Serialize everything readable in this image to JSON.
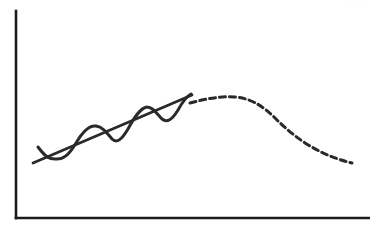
{
  "figure": {
    "width": 370,
    "height": 230,
    "background": "#ffffff",
    "corner_artifact": "···  ··"
  },
  "style": {
    "axis_color": "#1c1c1c",
    "axis_width": 2.6,
    "line_color": "#2a2a2a",
    "trend_width": 2.8,
    "noise_width": 3.0,
    "forecast_width": 3.0,
    "dash_pattern": "6 4"
  },
  "chart_data": {
    "type": "line",
    "title": "",
    "subtitle": "",
    "xlabel": "",
    "ylabel": "",
    "grid": false,
    "legend": "none",
    "xlim": [
      0,
      370
    ],
    "ylim": [
      0,
      230
    ],
    "axes": {
      "y_axis": {
        "x": 16,
        "y_top": 11,
        "y_bottom": 218
      },
      "x_axis": {
        "y": 218,
        "x_left": 16,
        "x_right": 370
      },
      "ticks": [],
      "tick_labels": []
    },
    "series": [
      {
        "name": "trend",
        "style": "solid",
        "description": "Rising straight trend line through the historical period",
        "points": [
          {
            "x": 33,
            "y": 163
          },
          {
            "x": 192,
            "y": 95
          }
        ],
        "path": "M 33 163 L 192 95"
      },
      {
        "name": "observed",
        "style": "solid",
        "description": "Oscillating hand-drawn data series weaving around the trend line",
        "points": [
          {
            "x": 38,
            "y": 147
          },
          {
            "x": 52,
            "y": 158
          },
          {
            "x": 62,
            "y": 160
          },
          {
            "x": 74,
            "y": 146
          },
          {
            "x": 86,
            "y": 128
          },
          {
            "x": 96,
            "y": 126
          },
          {
            "x": 106,
            "y": 136
          },
          {
            "x": 116,
            "y": 141
          },
          {
            "x": 126,
            "y": 132
          },
          {
            "x": 136,
            "y": 114
          },
          {
            "x": 146,
            "y": 107
          },
          {
            "x": 155,
            "y": 113
          },
          {
            "x": 163,
            "y": 120
          },
          {
            "x": 172,
            "y": 117
          },
          {
            "x": 181,
            "y": 104
          },
          {
            "x": 190,
            "y": 95
          }
        ],
        "path": "M 38 147 C 44 155, 48 159, 55 159 C 63 160, 69 155, 76 143 C 83 131, 89 125, 96 126 C 103 127, 107 133, 112 139 C 117 144, 122 139, 128 129 C 134 118, 140 108, 147 107 C 153 107, 157 114, 162 119 C 167 123, 172 120, 178 110 C 183 101, 187 96, 191 94"
      },
      {
        "name": "forecast",
        "style": "dashed",
        "description": "Dashed projection curve rising to a peak then declining",
        "points": [
          {
            "x": 190,
            "y": 103
          },
          {
            "x": 210,
            "y": 99
          },
          {
            "x": 232,
            "y": 97
          },
          {
            "x": 255,
            "y": 101
          },
          {
            "x": 280,
            "y": 113
          },
          {
            "x": 305,
            "y": 131
          },
          {
            "x": 330,
            "y": 150
          },
          {
            "x": 352,
            "y": 163
          }
        ],
        "path": "M 190 103 C 205 99, 220 96, 234 97 C 250 98, 262 105, 276 119 C 294 137, 318 155, 352 163"
      }
    ],
    "annotations": []
  }
}
